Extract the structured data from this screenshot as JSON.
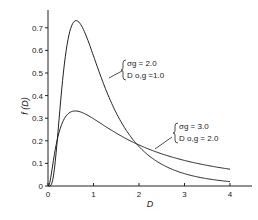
{
  "chart_data": {
    "type": "line",
    "title": "",
    "xlabel": "D",
    "ylabel": "f (D)",
    "xlim": [
      0,
      4.4
    ],
    "ylim": [
      0,
      0.78
    ],
    "x_ticks": [
      "0",
      "1",
      "2",
      "3",
      "4"
    ],
    "y_ticks": [
      "0",
      "0.1",
      "0.2",
      "0.3",
      "0.4",
      "0.5",
      "0.6",
      "0.7"
    ],
    "grid": false,
    "series": [
      {
        "name": "σg = 2.0, D o,g = 1.0",
        "label_line1": "σg = 2.0",
        "label_line2": "D o,g =1.0",
        "sigma_g": 2.0,
        "D0g": 1.0,
        "x": [
          0.1,
          0.2,
          0.3,
          0.4,
          0.5,
          0.62,
          0.8,
          1.0,
          1.5,
          2.0,
          2.5,
          3.0,
          3.5,
          4.0
        ],
        "values": [
          0.03,
          0.27,
          0.53,
          0.69,
          0.75,
          0.76,
          0.69,
          0.58,
          0.34,
          0.18,
          0.1,
          0.06,
          0.04,
          0.03
        ]
      },
      {
        "name": "σg = 3.0, D o,g = 2.0",
        "label_line1": "σg = 3.0",
        "label_line2": "D o,g = 2.0",
        "sigma_g": 3.0,
        "D0g": 2.0,
        "x": [
          0.1,
          0.2,
          0.3,
          0.4,
          0.6,
          0.8,
          1.0,
          1.5,
          2.0,
          2.5,
          3.0,
          3.5,
          4.0
        ],
        "values": [
          0.2,
          0.29,
          0.32,
          0.34,
          0.34,
          0.33,
          0.3,
          0.24,
          0.18,
          0.15,
          0.12,
          0.1,
          0.085
        ]
      }
    ]
  }
}
